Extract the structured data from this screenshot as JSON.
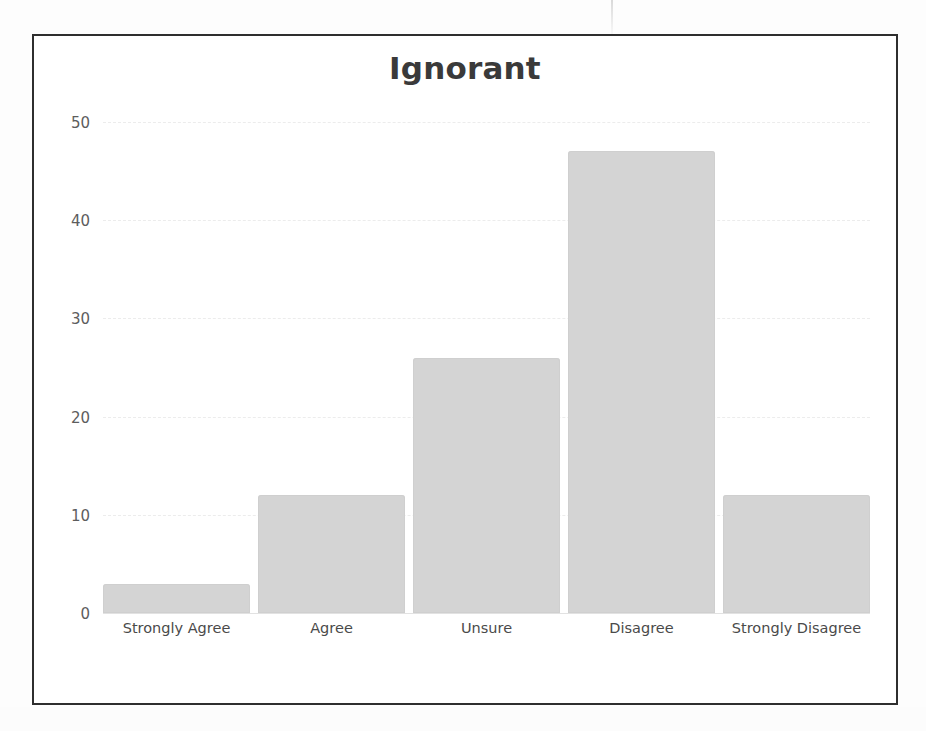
{
  "chart_data": {
    "type": "bar",
    "title": "Ignorant",
    "xlabel": "",
    "ylabel": "",
    "categories": [
      "Strongly Agree",
      "Agree",
      "Unsure",
      "Disagree",
      "Strongly Disagree"
    ],
    "values": [
      3,
      12,
      26,
      47,
      12
    ],
    "ylim": [
      0,
      50
    ],
    "ytick_labels": [
      "50",
      "40",
      "30",
      "20",
      "10",
      "0"
    ],
    "ytick_values": [
      50,
      40,
      30,
      20,
      10,
      0
    ],
    "grid": true,
    "legend": null,
    "legend_position": "none",
    "bar_color": "#d4d4d4",
    "frame_color": "#2e2e2e",
    "title_color": "#3a3a3a",
    "tick_label_color": "#4a4a4a"
  }
}
